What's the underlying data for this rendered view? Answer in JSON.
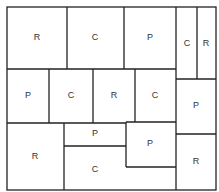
{
  "diagram": {
    "cells": [
      {
        "id": "r1c1",
        "label": "R",
        "x": 37,
        "y": 38
      },
      {
        "id": "r1c2",
        "label": "C",
        "x": 95,
        "y": 38
      },
      {
        "id": "r1c3",
        "label": "P",
        "x": 150,
        "y": 38
      },
      {
        "id": "r1c4",
        "label": "C",
        "x": 187,
        "y": 44
      },
      {
        "id": "r1c5",
        "label": "R",
        "x": 206,
        "y": 44
      },
      {
        "id": "r2c1",
        "label": "P",
        "x": 28,
        "y": 96
      },
      {
        "id": "r2c2",
        "label": "C",
        "x": 71,
        "y": 96
      },
      {
        "id": "r2c3",
        "label": "R",
        "x": 114,
        "y": 96
      },
      {
        "id": "r2c4",
        "label": "C",
        "x": 155,
        "y": 96
      },
      {
        "id": "r2c5",
        "label": "P",
        "x": 196,
        "y": 106
      },
      {
        "id": "r3c1",
        "label": "R",
        "x": 35,
        "y": 157
      },
      {
        "id": "r3c2",
        "label": "P",
        "x": 95,
        "y": 134
      },
      {
        "id": "r3c3",
        "label": "P",
        "x": 150,
        "y": 144
      },
      {
        "id": "r3c4",
        "label": "C",
        "x": 95,
        "y": 170
      },
      {
        "id": "r3c5",
        "label": "R",
        "x": 196,
        "y": 162
      }
    ]
  }
}
